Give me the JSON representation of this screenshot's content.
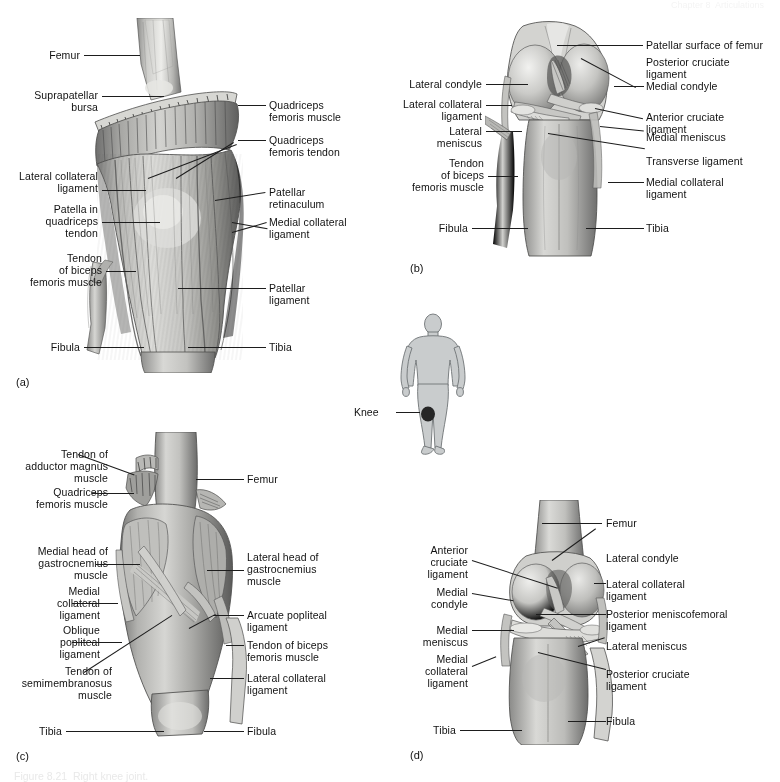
{
  "figure": {
    "header_text": "Chapter 8  Articulations",
    "caption": "Figure 8.21  Right knee joint.",
    "panel_letters": {
      "a": "(a)",
      "b": "(b)",
      "c": "(c)",
      "d": "(d)"
    }
  },
  "orientation_figure": {
    "name": "human-body-silhouette",
    "marker_label": "Knee",
    "body_fill": "#c9cccd",
    "body_stroke": "#6f7476",
    "marker_fill": "#262626"
  },
  "colors": {
    "ink": "#1a1a1a",
    "leader_line": "#1d1d1d",
    "bone_light": "#e3e3e1",
    "bone_mid": "#b4b4b2",
    "bone_dark": "#7d7d7c",
    "tissue_light": "#cfcfcc",
    "tissue_mid": "#9d9d9a",
    "tissue_dark": "#636362",
    "shadow": "#4a4a49",
    "page_bg": "#ffffff"
  },
  "panels": [
    {
      "id": "a",
      "letter": "(a)",
      "view": "anterior-view-superficial",
      "labels_left": [
        {
          "text": "Femur",
          "lines": [
            "Femur"
          ]
        },
        {
          "text": "Suprapatellar bursa",
          "lines": [
            "Suprapatellar",
            "bursa"
          ]
        },
        {
          "text": "Lateral collateral ligament",
          "lines": [
            "Lateral collateral",
            "ligament"
          ]
        },
        {
          "text": "Patella in quadriceps tendon",
          "lines": [
            "Patella in",
            "quadriceps",
            "tendon"
          ]
        },
        {
          "text": "Tendon of biceps femoris muscle",
          "lines": [
            "Tendon",
            "of biceps",
            "femoris muscle"
          ]
        },
        {
          "text": "Fibula",
          "lines": [
            "Fibula"
          ]
        }
      ],
      "labels_right": [
        {
          "text": "Quadriceps femoris muscle",
          "lines": [
            "Quadriceps",
            "femoris muscle"
          ]
        },
        {
          "text": "Quadriceps femoris tendon",
          "lines": [
            "Quadriceps",
            "femoris tendon"
          ]
        },
        {
          "text": "Patellar retinaculum",
          "lines": [
            "Patellar",
            "retinaculum"
          ]
        },
        {
          "text": "Medial collateral ligament",
          "lines": [
            "Medial collateral",
            "ligament"
          ]
        },
        {
          "text": "Patellar ligament",
          "lines": [
            "Patellar",
            "ligament"
          ]
        },
        {
          "text": "Tibia",
          "lines": [
            "Tibia"
          ]
        }
      ]
    },
    {
      "id": "b",
      "letter": "(b)",
      "view": "anterior-view-deep-flexed",
      "labels_left": [
        {
          "text": "Lateral condyle",
          "lines": [
            "Lateral condyle"
          ]
        },
        {
          "text": "Lateral collateral ligament",
          "lines": [
            "Lateral collateral",
            "ligament"
          ]
        },
        {
          "text": "Lateral meniscus",
          "lines": [
            "Lateral",
            "meniscus"
          ]
        },
        {
          "text": "Tendon of biceps femoris muscle",
          "lines": [
            "Tendon",
            "of biceps",
            "femoris muscle"
          ]
        },
        {
          "text": "Fibula",
          "lines": [
            "Fibula"
          ]
        }
      ],
      "labels_right": [
        {
          "text": "Patellar surface of femur",
          "lines": [
            "Patellar surface of femur"
          ]
        },
        {
          "text": "Posterior cruciate ligament",
          "lines": [
            "Posterior cruciate",
            "ligament"
          ]
        },
        {
          "text": "Medial condyle",
          "lines": [
            "Medial condyle"
          ]
        },
        {
          "text": "Anterior cruciate ligament",
          "lines": [
            "Anterior cruciate",
            "ligament"
          ]
        },
        {
          "text": "Medial meniscus",
          "lines": [
            "Medial meniscus"
          ]
        },
        {
          "text": "Transverse ligament",
          "lines": [
            "Transverse ligament"
          ]
        },
        {
          "text": "Medial collateral ligament",
          "lines": [
            "Medial collateral",
            "ligament"
          ]
        },
        {
          "text": "Tibia",
          "lines": [
            "Tibia"
          ]
        }
      ]
    },
    {
      "id": "c",
      "letter": "(c)",
      "view": "posterior-view-superficial",
      "labels_left": [
        {
          "text": "Tendon of adductor magnus muscle",
          "lines": [
            "Tendon of",
            "adductor magnus",
            "muscle"
          ]
        },
        {
          "text": "Quadriceps femoris muscle",
          "lines": [
            "Quadriceps",
            "femoris muscle"
          ]
        },
        {
          "text": "Medial head of gastrocnemius muscle",
          "lines": [
            "Medial head of",
            "gastrocnemius",
            "muscle"
          ]
        },
        {
          "text": "Medial collateral ligament",
          "lines": [
            "Medial",
            "collateral",
            "ligament"
          ]
        },
        {
          "text": "Oblique popliteal ligament",
          "lines": [
            "Oblique",
            "popliteal",
            "ligament"
          ]
        },
        {
          "text": "Tendon of semimembranosus muscle",
          "lines": [
            "Tendon of",
            "semimembranosus",
            "muscle"
          ]
        },
        {
          "text": "Tibia",
          "lines": [
            "Tibia"
          ]
        }
      ],
      "labels_right": [
        {
          "text": "Femur",
          "lines": [
            "Femur"
          ]
        },
        {
          "text": "Lateral head of gastrocnemius muscle",
          "lines": [
            "Lateral head of",
            "gastrocnemius",
            "muscle"
          ]
        },
        {
          "text": "Arcuate popliteal ligament",
          "lines": [
            "Arcuate popliteal",
            "ligament"
          ]
        },
        {
          "text": "Tendon of biceps femoris muscle",
          "lines": [
            "Tendon of biceps",
            "femoris muscle"
          ]
        },
        {
          "text": "Lateral collateral ligament",
          "lines": [
            "Lateral collateral",
            "ligament"
          ]
        },
        {
          "text": "Fibula",
          "lines": [
            "Fibula"
          ]
        }
      ]
    },
    {
      "id": "d",
      "letter": "(d)",
      "view": "posterior-view-deep",
      "labels_left": [
        {
          "text": "Anterior cruciate ligament",
          "lines": [
            "Anterior",
            "cruciate",
            "ligament"
          ]
        },
        {
          "text": "Medial condyle",
          "lines": [
            "Medial",
            "condyle"
          ]
        },
        {
          "text": "Medial meniscus",
          "lines": [
            "Medial",
            "meniscus"
          ]
        },
        {
          "text": "Medial collateral ligament",
          "lines": [
            "Medial",
            "collateral",
            "ligament"
          ]
        },
        {
          "text": "Tibia",
          "lines": [
            "Tibia"
          ]
        }
      ],
      "labels_right": [
        {
          "text": "Femur",
          "lines": [
            "Femur"
          ]
        },
        {
          "text": "Lateral condyle",
          "lines": [
            "Lateral condyle"
          ]
        },
        {
          "text": "Lateral collateral ligament",
          "lines": [
            "Lateral collateral",
            "ligament"
          ]
        },
        {
          "text": "Posterior meniscofemoral ligament",
          "lines": [
            "Posterior meniscofemoral",
            "ligament"
          ]
        },
        {
          "text": "Lateral meniscus",
          "lines": [
            "Lateral meniscus"
          ]
        },
        {
          "text": "Posterior cruciate ligament",
          "lines": [
            "Posterior cruciate",
            "ligament"
          ]
        },
        {
          "text": "Fibula",
          "lines": [
            "Fibula"
          ]
        }
      ]
    }
  ]
}
